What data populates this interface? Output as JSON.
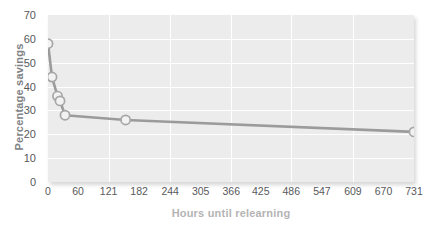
{
  "chart_data": {
    "type": "line",
    "title": "",
    "xlabel": "Hours until relearning",
    "ylabel": "Percentage savings",
    "xlim": [
      0,
      731
    ],
    "ylim": [
      0,
      70
    ],
    "grid": true,
    "legend": null,
    "x_ticks": [
      0,
      60,
      121,
      182,
      244,
      305,
      366,
      425,
      486,
      547,
      609,
      670,
      731
    ],
    "y_ticks": [
      0,
      10,
      20,
      30,
      40,
      50,
      60,
      70
    ],
    "x_gridlines": [
      121,
      244,
      366,
      486,
      609,
      731
    ],
    "y_gridlines": [
      10,
      20,
      30,
      40,
      50,
      60
    ],
    "series": [
      {
        "name": "Percentage savings",
        "x": [
          0,
          8,
          19,
          24,
          34,
          155,
          731
        ],
        "y": [
          58,
          44,
          36,
          34,
          28,
          26,
          21
        ],
        "line_color": "#9b9b9b",
        "marker_face_color": "#f2f2f2",
        "marker_edge_color": "#a6a6a6"
      }
    ],
    "points": [
      {
        "x": 0,
        "y": 58
      },
      {
        "x": 8,
        "y": 44
      },
      {
        "x": 19,
        "y": 36
      },
      {
        "x": 24,
        "y": 34
      },
      {
        "x": 34,
        "y": 28
      },
      {
        "x": 155,
        "y": 26
      },
      {
        "x": 731,
        "y": 21
      }
    ]
  },
  "style": {
    "plot_background": "#ececec",
    "page_background": "#ffffff",
    "grid_color": "#ffffff",
    "tick_label_color": "#58595b",
    "xlabel_color": "#b4b4b4",
    "ylabel_color": "#808285"
  }
}
